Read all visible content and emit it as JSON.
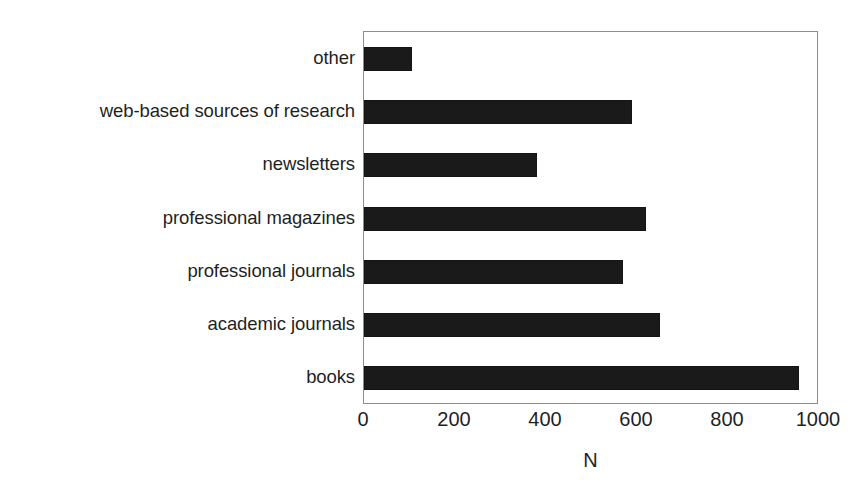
{
  "chart_data": {
    "type": "bar",
    "orientation": "horizontal",
    "title": "",
    "xlabel": "N",
    "ylabel": "",
    "categories": [
      "other",
      "web-based sources of research",
      "newsletters",
      "professional magazines",
      "professional journals",
      "academic journals",
      "books"
    ],
    "values": [
      105,
      590,
      380,
      620,
      570,
      650,
      955
    ],
    "xlim": [
      0,
      1000
    ],
    "xticks": [
      0,
      200,
      400,
      600,
      800,
      1000
    ],
    "xtick_labels": [
      "0",
      "200",
      "400",
      "600",
      "800",
      "1000"
    ],
    "grid": false,
    "legend": false,
    "bar_color": "#1a1a1a",
    "frame_color": "#8d8d8d",
    "background": "#ffffff"
  }
}
